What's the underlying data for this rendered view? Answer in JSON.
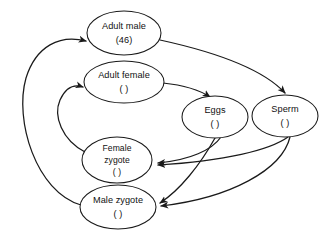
{
  "diagram": {
    "background_color": "#ffffff",
    "line_color": "#1a1a1a",
    "text_color": "#111111",
    "nodes": [
      {
        "id": "adult-male",
        "name": "adult-male-node",
        "lines": [
          "Adult male",
          "(46)"
        ],
        "cx": 124,
        "cy": 33,
        "rx": 37,
        "ry": 22
      },
      {
        "id": "adult-female",
        "name": "adult-female-node",
        "lines": [
          "Adult female",
          "(  )"
        ],
        "cx": 124,
        "cy": 82,
        "rx": 40,
        "ry": 21
      },
      {
        "id": "eggs",
        "name": "eggs-node",
        "lines": [
          "Eggs",
          "(  )"
        ],
        "cx": 215,
        "cy": 117,
        "rx": 33,
        "ry": 21
      },
      {
        "id": "sperm",
        "name": "sperm-node",
        "lines": [
          "Sperm",
          "(  )"
        ],
        "cx": 285,
        "cy": 116,
        "rx": 33,
        "ry": 21
      },
      {
        "id": "female-zygote",
        "name": "female-zygote-node",
        "lines": [
          "Female",
          "zygote",
          "(  )"
        ],
        "cx": 117,
        "cy": 160,
        "rx": 35,
        "ry": 23
      },
      {
        "id": "male-zygote",
        "name": "male-zygote-node",
        "lines": [
          "Male zygote",
          "(  )"
        ],
        "cx": 118,
        "cy": 207,
        "rx": 38,
        "ry": 22
      }
    ],
    "edges": [
      {
        "id": "adult-male-to-sperm",
        "name": "edge-adult-male-to-sperm",
        "from": "adult-male",
        "to": "sperm",
        "path": "M 160,40 C 215,52 262,68 285,93"
      },
      {
        "id": "adult-female-to-eggs",
        "name": "edge-adult-female-to-eggs",
        "from": "adult-female",
        "to": "eggs",
        "path": "M 163,83 C 182,85 198,89 210,97"
      },
      {
        "id": "eggs-to-female-zygote",
        "name": "edge-eggs-to-female-zygote",
        "from": "eggs",
        "to": "female-zygote",
        "path": "M 221,137 C 212,150 190,160 158,163"
      },
      {
        "id": "eggs-to-male-zygote",
        "name": "edge-eggs-to-male-zygote",
        "from": "eggs",
        "to": "male-zygote",
        "path": "M 215,138 C 200,165 180,190 160,203"
      },
      {
        "id": "sperm-to-female-zygote",
        "name": "edge-sperm-to-female-zygote",
        "from": "sperm",
        "to": "female-zygote",
        "path": "M 288,137 C 270,150 225,161 158,165"
      },
      {
        "id": "sperm-to-male-zygote",
        "name": "edge-sperm-to-male-zygote",
        "from": "sperm",
        "to": "male-zygote",
        "path": "M 290,137 C 282,170 230,198 161,206"
      },
      {
        "id": "male-zygote-to-adult-male",
        "name": "edge-male-zygote-to-adult-male",
        "from": "male-zygote",
        "to": "adult-male",
        "path": "M 81,205 C 36,192 14,120 26,78 C 36,46 60,34 86,41"
      },
      {
        "id": "female-zygote-to-adult-female",
        "name": "edge-female-zygote-to-adult-female",
        "from": "female-zygote",
        "to": "adult-female",
        "path": "M 85,152 C 62,140 53,116 60,100 C 66,87 74,84 83,87"
      }
    ]
  }
}
